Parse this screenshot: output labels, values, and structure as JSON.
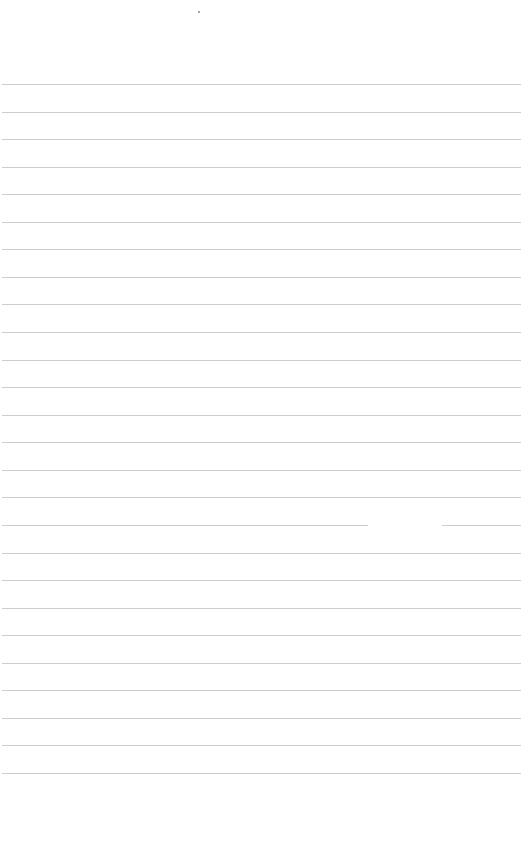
{
  "page": {
    "type": "lined-paper",
    "background_color": "#ffffff",
    "line_color": "#cdcdcd",
    "line_count": 26,
    "first_line_y": 84,
    "line_spacing": 27.56,
    "line_left": 2,
    "line_right": 521,
    "top_mark": {
      "x": 199,
      "y": 12
    },
    "broken_line_index": 16,
    "broken_line_gap": [
      368,
      442
    ]
  }
}
